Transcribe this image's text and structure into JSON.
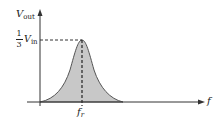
{
  "diagram": {
    "type": "frequency-response-bandpass",
    "y_axis": {
      "label": "V",
      "label_sub": "out"
    },
    "x_axis": {
      "label": "f"
    },
    "peak": {
      "level_label_num": "1",
      "level_label_den": "3",
      "level_label_v": "V",
      "level_label_sub": "in",
      "freq_label": "f",
      "freq_label_sub": "r"
    },
    "colors": {
      "fill": "#c8c8c8",
      "stroke": "#444444",
      "axis": "#333333"
    }
  }
}
